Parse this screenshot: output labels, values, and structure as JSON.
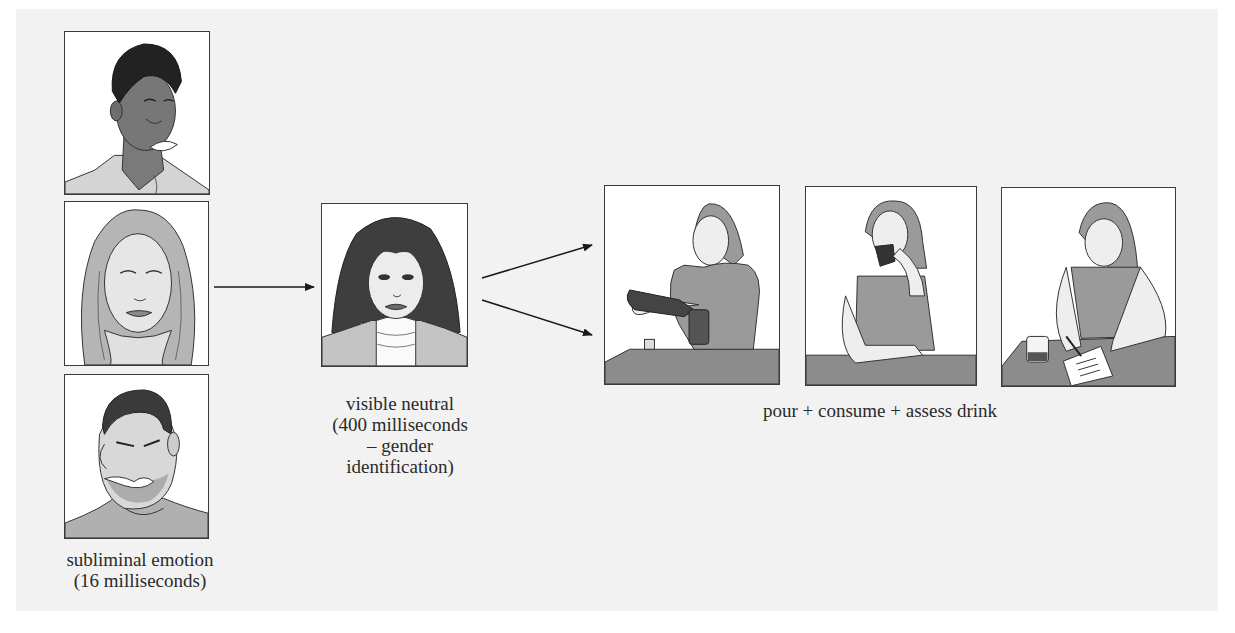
{
  "diagram": {
    "type": "experimental-procedure-sequence",
    "stages": [
      {
        "id": "subliminal",
        "caption_line1": "subliminal emotion",
        "caption_line2": "(16 milliseconds)",
        "images": [
          {
            "name": "happy-face",
            "description": "smiling man"
          },
          {
            "name": "neutral-face",
            "description": "neutral woman with long light hair"
          },
          {
            "name": "angry-face",
            "description": "angry man gritting teeth"
          }
        ]
      },
      {
        "id": "visible-neutral",
        "caption_line1": "visible neutral",
        "caption_line2": "(400 milliseconds",
        "caption_line3": "– gender",
        "caption_line4": "identification)",
        "images": [
          {
            "name": "neutral-target-face",
            "description": "woman with dark hair and turtleneck"
          }
        ]
      },
      {
        "id": "drink-task",
        "caption": "pour + consume + assess drink",
        "images": [
          {
            "name": "pour-drink",
            "description": "woman pouring drink from bottle into glass"
          },
          {
            "name": "consume-drink",
            "description": "woman drinking from glass"
          },
          {
            "name": "assess-drink",
            "description": "woman filling out rating form next to glass"
          }
        ]
      }
    ],
    "connections": [
      {
        "from": "subliminal",
        "to": "visible-neutral"
      },
      {
        "from": "visible-neutral",
        "to": "drink-task",
        "count": 2
      }
    ],
    "colors": {
      "background": "#f2f2f2",
      "frame_border": "#3a3a3a",
      "text": "#2a2a2a",
      "arrow": "#1a1a1a"
    }
  }
}
